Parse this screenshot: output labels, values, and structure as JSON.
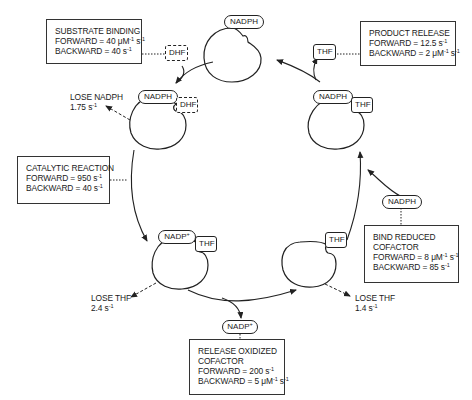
{
  "diagram": {
    "type": "enzyme-kinetic-cycle",
    "nodes": [
      {
        "id": "E-NADPH",
        "cofactor": "NADPH",
        "ligand": null
      },
      {
        "id": "E-NADPH-DHF",
        "cofactor": "NADPH",
        "ligand": "DHF"
      },
      {
        "id": "E-NADP+-THF",
        "cofactor": "NADP+",
        "ligand": "THF"
      },
      {
        "id": "E-THF",
        "cofactor": null,
        "ligand": "THF"
      },
      {
        "id": "E-NADPH-THF",
        "cofactor": "NADPH",
        "ligand": "THF"
      }
    ],
    "edges": [
      {
        "from": "E-NADPH",
        "to": "E-NADPH-DHF",
        "step": "substrate_binding"
      },
      {
        "from": "E-NADPH-DHF",
        "to": "E-NADP+-THF",
        "step": "catalytic_reaction"
      },
      {
        "from": "E-NADP+-THF",
        "to": "E-THF",
        "step": "release_oxidized_cofactor"
      },
      {
        "from": "E-THF",
        "to": "E-NADPH-THF",
        "step": "bind_reduced_cofactor"
      },
      {
        "from": "E-NADPH-THF",
        "to": "E-NADPH",
        "step": "product_release"
      }
    ]
  },
  "enzymes": {
    "top": {
      "cofactor": "NADPH"
    },
    "upper_left": {
      "cofactor": "NADPH",
      "ligand": "DHF"
    },
    "upper_right": {
      "cofactor": "NADPH",
      "ligand": "THF"
    },
    "lower_left": {
      "cofactor": "NADP",
      "cofactor_sup": "+",
      "ligand": "THF"
    },
    "lower_right": {
      "ligand": "THF"
    }
  },
  "free_ligands": {
    "dhf": "DHF",
    "thf": "THF",
    "nadph": "NADPH",
    "nadp": "NADP",
    "nadp_sup": "+"
  },
  "steps": {
    "substrate_binding": {
      "title": "SUBSTRATE BINDING",
      "forward_prefix": "FORWARD = 40 μM",
      "forward_sup1": "-1",
      "forward_mid": " s",
      "forward_sup2": "-1",
      "backward_prefix": "BACKWARD = 40 s",
      "backward_sup1": "-1"
    },
    "product_release": {
      "title": "PRODUCT RELEASE",
      "forward_prefix": "FORWARD = 12.5 s",
      "forward_sup1": "-1",
      "backward_prefix": "BACKWARD = 2 μM",
      "backward_sup1": "-1",
      "backward_mid": " s",
      "backward_sup2": "-1"
    },
    "catalytic_reaction": {
      "title": "CATALYTIC REACTION",
      "forward_prefix": "FORWARD = 950 s",
      "forward_sup1": "-1",
      "backward_prefix": "BACKWARD = 40 s",
      "backward_sup1": "-1"
    },
    "bind_reduced_cofactor": {
      "title1": "BIND REDUCED",
      "title2": "COFACTOR",
      "forward_prefix": "FORWARD = 8 μM",
      "forward_sup1": "-1",
      "forward_mid": " s",
      "forward_sup2": "-1",
      "backward_prefix": "BACKWARD = 85 s",
      "backward_sup1": "-1"
    },
    "release_oxidized_cofactor": {
      "title1": "RELEASE OXIDIZED",
      "title2": "COFACTOR",
      "forward_prefix": "FORWARD = 200 s",
      "forward_sup1": "-1",
      "backward_prefix": "BACKWARD = 5 μM",
      "backward_sup1": "-1",
      "backward_mid": " s",
      "backward_sup2": "-1"
    }
  },
  "losses": {
    "lose_nadph": {
      "label": "LOSE NADPH",
      "rate": "1.75 s",
      "sup": "-1"
    },
    "lose_thf_left": {
      "label": "LOSE THF",
      "rate": "2.4 s",
      "sup": "-1"
    },
    "lose_thf_right": {
      "label": "LOSE THF",
      "rate": "1.4 s",
      "sup": "-1"
    }
  },
  "colors": {
    "line": "#222222",
    "background": "#ffffff"
  }
}
